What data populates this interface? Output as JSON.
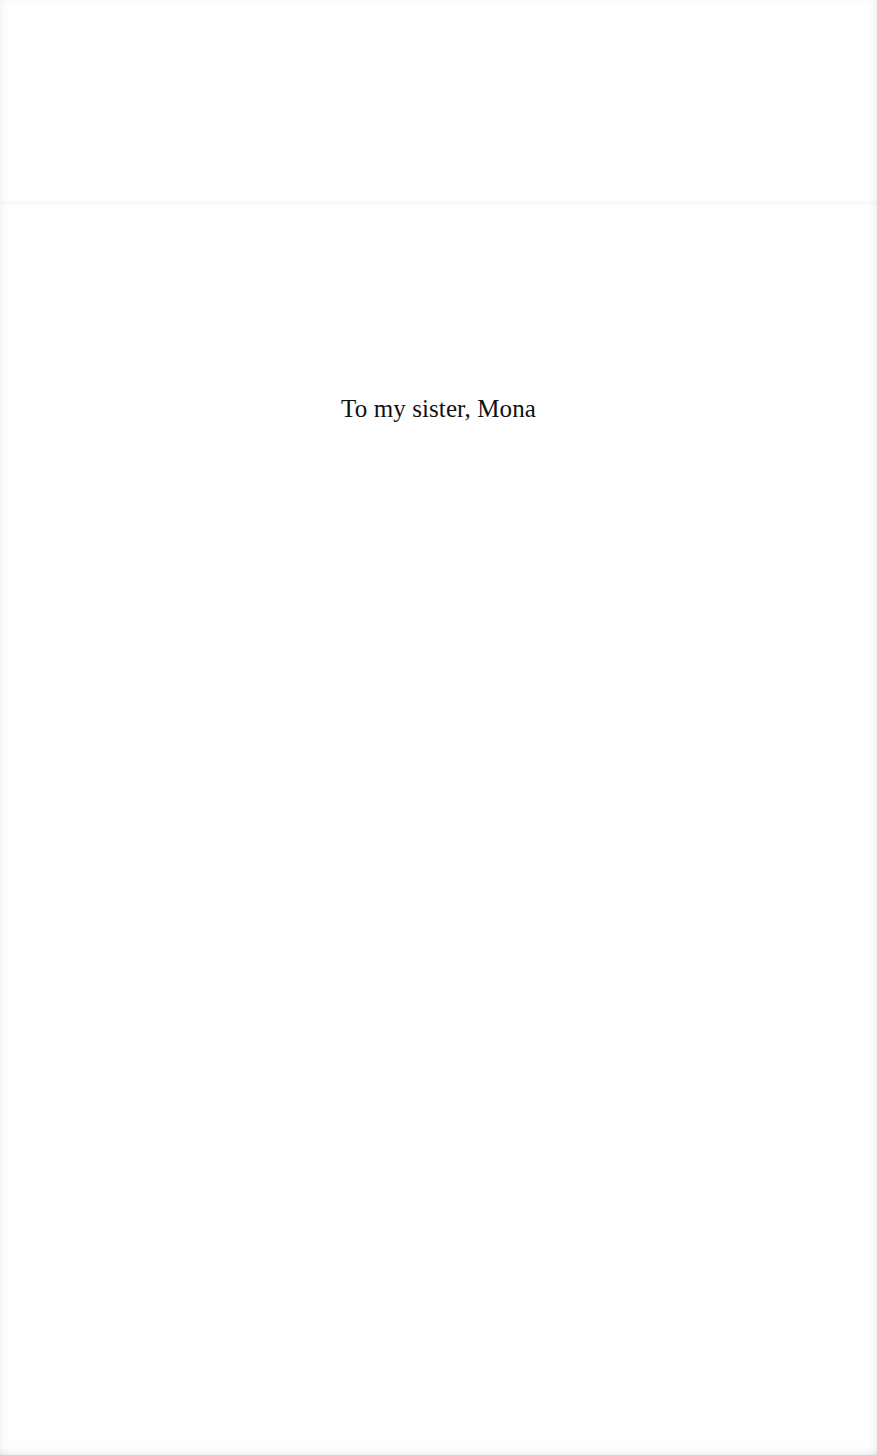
{
  "page": {
    "dedication": "To my sister, Mona"
  },
  "colors": {
    "paper": "#fefefe",
    "text": "#111111"
  }
}
